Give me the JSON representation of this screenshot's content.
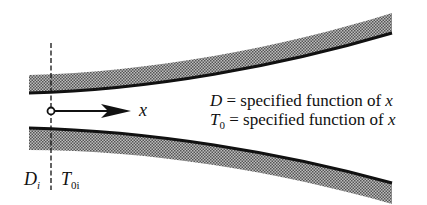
{
  "diagram": {
    "axis": {
      "label": "x"
    },
    "equations": [
      {
        "var": "D",
        "sub": "",
        "rest": "= specified function of ",
        "arg": "x"
      },
      {
        "var": "T",
        "sub": "0",
        "rest": "= specified function of ",
        "arg": "x"
      }
    ],
    "inlet_labels": [
      {
        "var": "D",
        "sub": "i"
      },
      {
        "var": "T",
        "sub": "0i"
      }
    ],
    "colors": {
      "line": "#111111",
      "hatch_dark": "#555555",
      "hatch_light": "#bdbdbd",
      "background": "#ffffff"
    }
  }
}
